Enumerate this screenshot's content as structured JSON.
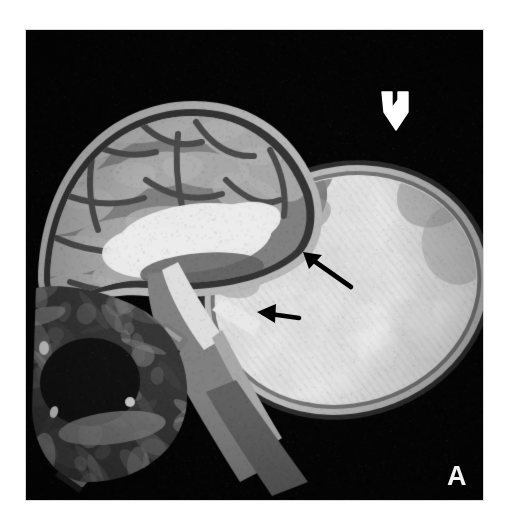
{
  "figure": {
    "panel_label": "A",
    "modality": "MRI",
    "plane": "sagittal",
    "caption_visible": false,
    "plate": {
      "x": 26,
      "y": 30,
      "width": 457,
      "height": 470,
      "background_color": "#050505",
      "margin_color": "#ffffff"
    }
  },
  "colors": {
    "background": "#ffffff",
    "image_background": "#050505",
    "bright_tissue": "#f0efe9",
    "mid_tissue": "#9a9a92",
    "dark_tissue": "#3a3a38",
    "csf_bright": "#ededea",
    "annotation_black": "#000000",
    "annotation_white": "#ffffff",
    "label_text": "#f2f2f2"
  },
  "anatomy": [
    {
      "name": "cranial-vault",
      "label": "skull and scalp",
      "description": "bright curvilinear rim over the left-sided cranium"
    },
    {
      "name": "cerebrum",
      "label": "cerebral hemisphere",
      "description": "gyri and sulci of the brain, mid-grey with darker sulcal lines"
    },
    {
      "name": "ventricle-csf",
      "label": "ventricle / CSF space",
      "description": "bright high-signal fluid collection centrally within the brain"
    },
    {
      "name": "posterior-fossa",
      "label": "posterior fossa",
      "description": "region below the tentorium adjoining the lesion neck"
    },
    {
      "name": "brainstem",
      "label": "brainstem",
      "description": "vertical mid-grey band descending toward the foramen magnum"
    },
    {
      "name": "cervical-spine",
      "label": "cervical vertebral column",
      "description": "stacked vertebral bodies running inferoposteriorly"
    },
    {
      "name": "facial-structures",
      "label": "face and oral cavity",
      "description": "dark low-signal structures of the lower left of the image"
    },
    {
      "name": "cystic-mass",
      "label": "large cystic occipital mass",
      "description": "large ovoid uniformly bright fluid-signal mass projecting posteriorly with a thin capsule"
    },
    {
      "name": "lesion-neck",
      "label": "neck / stalk of the lesion",
      "description": "narrow defect where the mass communicates with the intracranial compartment"
    }
  ],
  "annotations": [
    {
      "id": "open-arrow-top",
      "name": "white-open-arrow",
      "style": "hollow white outlined arrow",
      "direction": "down",
      "color": "#ffffff",
      "tip_x": 370,
      "tip_y": 92,
      "points_to": "superior margin / dome of the cystic mass"
    },
    {
      "id": "black-arrow-upper",
      "name": "black-arrow-upper",
      "style": "solid black arrow",
      "direction": "up-left",
      "color": "#000000",
      "tip_x": 277,
      "tip_y": 222,
      "points_to": "upper aspect of the lesion neck / dysplastic tissue"
    },
    {
      "id": "black-arrow-lower",
      "name": "black-arrow-lower",
      "style": "solid black arrow",
      "direction": "left",
      "color": "#000000",
      "tip_x": 231,
      "tip_y": 282,
      "points_to": "inferior aspect of the lesion neck / bony defect"
    }
  ]
}
